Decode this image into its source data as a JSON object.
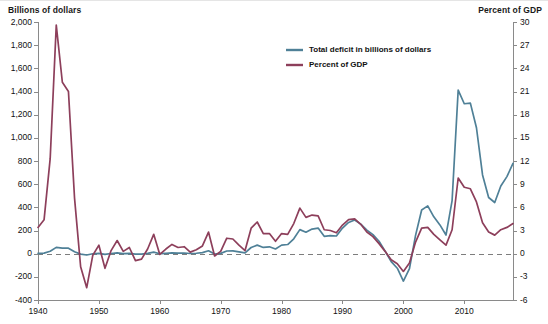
{
  "axis_titles": {
    "left": "Billions of dollars",
    "right": "Percent of GDP"
  },
  "legend": {
    "position": "top-center",
    "items": [
      {
        "label": "Total deficit in billions of dollars",
        "color": "#4f8097"
      },
      {
        "label": "Percent of GDP",
        "color": "#8d3f5b"
      }
    ]
  },
  "chart_data": {
    "type": "line",
    "title": "",
    "subtitle": "",
    "xlabel": "",
    "ylabel": "Billions of dollars",
    "y2label": "Percent of GDP",
    "grid": false,
    "zero_reference_line": true,
    "xlim": [
      1940,
      2018
    ],
    "ylim": [
      -400,
      2000
    ],
    "y2lim": [
      -6,
      30
    ],
    "xticks": [
      1940,
      1950,
      1960,
      1970,
      1980,
      1990,
      2000,
      2010
    ],
    "xtick_labels": [
      "1940",
      "1950",
      "1960",
      "1970",
      "1980",
      "1990",
      "2000",
      "2010"
    ],
    "yticks": [
      -400,
      -200,
      0,
      200,
      400,
      600,
      800,
      1000,
      1200,
      1400,
      1600,
      1800,
      2000
    ],
    "ytick_labels": [
      "-400",
      "-200",
      "0",
      "200",
      "400",
      "600",
      "800",
      "1,000",
      "1,200",
      "1,400",
      "1,600",
      "1,800",
      "2,000"
    ],
    "y2ticks": [
      -6,
      -3,
      0,
      3,
      6,
      9,
      12,
      15,
      18,
      21,
      24,
      27,
      30
    ],
    "y2tick_labels": [
      "-6",
      "-3",
      "0",
      "3",
      "6",
      "9",
      "12",
      "15",
      "18",
      "21",
      "24",
      "27",
      "30"
    ],
    "x": [
      1940,
      1941,
      1942,
      1943,
      1944,
      1945,
      1946,
      1947,
      1948,
      1949,
      1950,
      1951,
      1952,
      1953,
      1954,
      1955,
      1956,
      1957,
      1958,
      1959,
      1960,
      1961,
      1962,
      1963,
      1964,
      1965,
      1966,
      1967,
      1968,
      1969,
      1970,
      1971,
      1972,
      1973,
      1974,
      1975,
      1976,
      1977,
      1978,
      1979,
      1980,
      1981,
      1982,
      1983,
      1984,
      1985,
      1986,
      1987,
      1988,
      1989,
      1990,
      1991,
      1992,
      1993,
      1994,
      1995,
      1996,
      1997,
      1998,
      1999,
      2000,
      2001,
      2002,
      2003,
      2004,
      2005,
      2006,
      2007,
      2008,
      2009,
      2010,
      2011,
      2012,
      2013,
      2014,
      2015,
      2016,
      2017,
      2018
    ],
    "series": [
      {
        "name": "Total deficit in billions of dollars",
        "color": "#4f8097",
        "axis": "left",
        "values": [
          2.9,
          4.9,
          20.5,
          54.6,
          47.6,
          47.6,
          15.9,
          -4.0,
          -11.8,
          -0.6,
          3.1,
          -6.1,
          1.5,
          6.5,
          1.2,
          3.0,
          -3.9,
          -3.4,
          2.8,
          12.8,
          -0.3,
          3.3,
          7.1,
          4.8,
          5.9,
          1.4,
          3.7,
          8.6,
          25.2,
          -3.2,
          2.8,
          23.0,
          23.4,
          14.9,
          6.1,
          53.2,
          73.7,
          53.7,
          59.2,
          40.7,
          73.8,
          79.0,
          128.0,
          207.8,
          185.4,
          212.3,
          221.2,
          149.7,
          155.2,
          152.6,
          221.0,
          269.2,
          290.3,
          255.1,
          203.2,
          164.0,
          107.4,
          21.9,
          -69.3,
          -125.6,
          -236.2,
          -128.2,
          157.8,
          377.6,
          412.7,
          318.3,
          248.2,
          160.7,
          458.6,
          1412.7,
          1294.4,
          1299.6,
          1087.0,
          679.5,
          484.6,
          441.9,
          584.7,
          665.4,
          779.0
        ]
      },
      {
        "name": "Percent of GDP",
        "color": "#8d3f5b",
        "axis": "right",
        "values": [
          3.4,
          4.4,
          12.3,
          29.6,
          22.2,
          21.0,
          7.2,
          -1.7,
          -4.4,
          -0.2,
          1.1,
          -1.9,
          0.4,
          1.7,
          0.3,
          0.8,
          -0.9,
          -0.7,
          0.6,
          2.5,
          -0.1,
          0.6,
          1.2,
          0.8,
          0.9,
          0.2,
          0.5,
          1.0,
          2.8,
          -0.3,
          0.3,
          2.0,
          1.9,
          1.1,
          0.4,
          3.3,
          4.1,
          2.6,
          2.6,
          1.6,
          2.6,
          2.5,
          3.9,
          5.9,
          4.7,
          5.0,
          4.9,
          3.1,
          3.0,
          2.7,
          3.7,
          4.4,
          4.5,
          3.8,
          2.8,
          2.2,
          1.3,
          0.3,
          -0.8,
          -1.3,
          -2.3,
          -1.2,
          1.5,
          3.3,
          3.4,
          2.5,
          1.8,
          1.1,
          3.1,
          9.8,
          8.6,
          8.4,
          6.7,
          4.0,
          2.8,
          2.4,
          3.1,
          3.4,
          3.9
        ]
      }
    ]
  }
}
